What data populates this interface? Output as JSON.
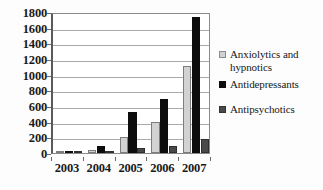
{
  "chart_data": {
    "type": "bar",
    "title": "",
    "subtitle": "",
    "xlabel": "",
    "ylabel": "",
    "categories": [
      "2003",
      "2004",
      "2005",
      "2006",
      "2007"
    ],
    "series": [
      {
        "name": "Anxiolytics and hypnotics",
        "color": "#d2d2d2",
        "values": [
          5,
          35,
          200,
          395,
          1110
        ]
      },
      {
        "name": "Antidepressants",
        "color": "#0d0d0d",
        "values": [
          10,
          90,
          520,
          685,
          1740
        ]
      },
      {
        "name": "Antipsychotics",
        "color": "#494949",
        "values": [
          5,
          25,
          60,
          95,
          185
        ]
      }
    ],
    "ylim": [
      0,
      1800
    ],
    "ytick_step": 200,
    "yticks": [
      "1800",
      "1600",
      "1400",
      "1200",
      "1000",
      "800",
      "600",
      "400",
      "200",
      "0"
    ],
    "grid": true,
    "legend_position": "right"
  },
  "legend": {
    "entries": [
      {
        "label_line1": "Anxiolytics and",
        "label_line2": "hypnotics"
      },
      {
        "label": "Antidepressants"
      },
      {
        "label": "Antipsychotics"
      }
    ]
  }
}
